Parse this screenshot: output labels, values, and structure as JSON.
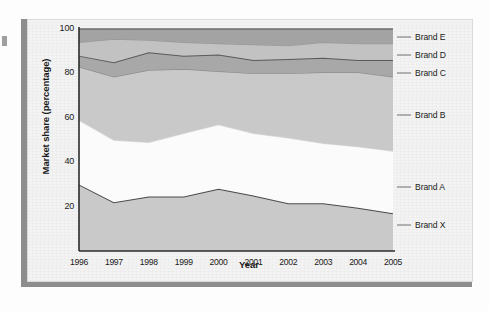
{
  "figure": {
    "kind": "stacked-area-chart",
    "background_color": "#f3f3f3",
    "panel_border_color": "#dadada",
    "shadow_color": "#8d8d8d"
  },
  "axes": {
    "y_title": "Market share (percentage)",
    "x_title": "Year",
    "y_ticks": [
      "100",
      "80",
      "60",
      "40",
      "20"
    ],
    "x_ticks": [
      "1996",
      "1997",
      "1998",
      "1999",
      "2000",
      "2001",
      "2002",
      "2003",
      "2004",
      "2005"
    ],
    "axis_color": "#2b2b2b"
  },
  "series_labels": [
    {
      "name": "label-brand-e",
      "text": "Brand E"
    },
    {
      "name": "label-brand-d",
      "text": "Brand D"
    },
    {
      "name": "label-brand-c",
      "text": "Brand C"
    },
    {
      "name": "label-brand-b",
      "text": "Brand B"
    },
    {
      "name": "label-brand-a",
      "text": "Brand A"
    },
    {
      "name": "label-brand-x",
      "text": "Brand X"
    }
  ],
  "chart_data": {
    "type": "area",
    "stacked": true,
    "title": "",
    "subtitle": "",
    "xlabel": "Year",
    "ylabel": "Market share (percentage)",
    "x": [
      1996,
      1997,
      1998,
      1999,
      2000,
      2001,
      2002,
      2003,
      2004,
      2005
    ],
    "categories": [
      "1996",
      "1997",
      "1998",
      "1999",
      "2000",
      "2001",
      "2002",
      "2003",
      "2004",
      "2005"
    ],
    "xlim": [
      1996,
      2005
    ],
    "ylim": [
      0,
      100
    ],
    "yticks": [
      20,
      40,
      60,
      80,
      100
    ],
    "grid": false,
    "legend_position": "right-outside-leader-lines",
    "series": [
      {
        "name": "Brand X",
        "color": "#c9c9c9",
        "line_color": "#4a4a4a",
        "values": [
          30,
          22,
          24.5,
          24.5,
          28,
          25,
          21.5,
          21.5,
          19.5,
          17
        ],
        "cumulative_top": [
          30,
          22,
          24.5,
          24.5,
          28,
          25,
          21.5,
          21.5,
          19.5,
          17
        ]
      },
      {
        "name": "Brand A",
        "color": "#fbfbfb",
        "line_color": "#d8d8d8",
        "values": [
          29,
          28,
          24.5,
          28.5,
          29,
          28,
          29.5,
          27,
          27.5,
          28
        ],
        "cumulative_top": [
          59,
          50,
          49,
          53,
          57,
          53,
          51,
          48.5,
          47,
          45
        ]
      },
      {
        "name": "Brand B",
        "color": "#c9c9c9",
        "line_color": "#8f8f8f",
        "values": [
          24,
          28.5,
          32.5,
          29,
          24,
          27,
          29,
          32,
          33.5,
          33.5
        ],
        "cumulative_top": [
          83,
          78.5,
          81.5,
          82,
          81,
          80,
          80,
          80.5,
          80.5,
          78.5
        ]
      },
      {
        "name": "Brand C",
        "color": "#a8a8a8",
        "line_color": "#5a5a5a",
        "values": [
          5,
          6.5,
          8,
          6,
          7.5,
          6,
          6.5,
          6.5,
          5.5,
          7.5
        ],
        "cumulative_top": [
          88,
          85,
          89.5,
          88,
          88.5,
          86,
          86.5,
          87,
          86,
          86
        ]
      },
      {
        "name": "Brand D",
        "color": "#c2c2c2",
        "line_color": "#9a9a9a",
        "values": [
          6,
          10.5,
          5.5,
          6,
          5,
          7,
          6,
          7,
          7.5,
          7.5
        ],
        "cumulative_top": [
          94,
          95.5,
          95,
          94,
          93.5,
          93,
          92.5,
          94,
          93.5,
          93.5
        ]
      },
      {
        "name": "Brand E",
        "color": "#a3a3a3",
        "line_color": "#6e6e6e",
        "values": [
          6,
          4.5,
          5,
          6,
          6.5,
          7,
          7.5,
          6,
          6.5,
          6.5
        ],
        "cumulative_top": [
          100,
          100,
          100,
          100,
          100,
          100,
          100,
          100,
          100,
          100
        ]
      }
    ]
  }
}
